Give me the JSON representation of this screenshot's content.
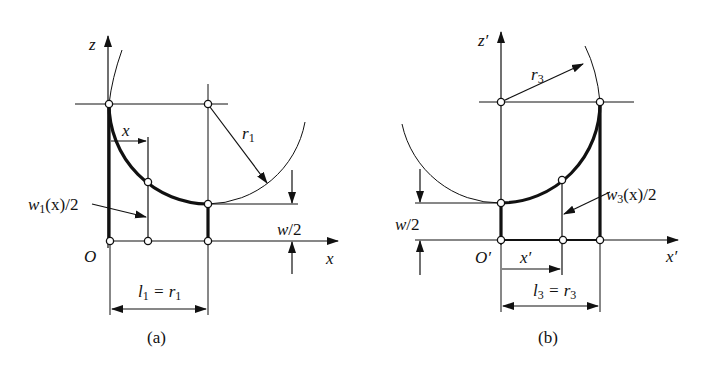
{
  "figure_a": {
    "axis_z_label": "z",
    "axis_x_label": "x",
    "origin_label": "O",
    "x_dim_label": "x",
    "radius_label": "r",
    "radius_sub": "1",
    "width_fn_label_w": "w",
    "width_fn_sub": "1",
    "width_fn_rest": "(x)/2",
    "half_width_label": "w/2",
    "length_l": "l",
    "length_l_sub": "1",
    "length_eq": " = r",
    "length_r_sub": "1",
    "caption": "(a)"
  },
  "figure_b": {
    "axis_z_label": "z′",
    "axis_x_label": "x′",
    "origin_label": "O′",
    "x_dim_label": "x′",
    "radius_label": "r",
    "radius_sub": "3",
    "width_fn_label_w": "w",
    "width_fn_sub": "3",
    "width_fn_rest": "(x)/2",
    "half_width_label": "w/2",
    "length_l": "l",
    "length_l_sub": "3",
    "length_eq": " = r",
    "length_r_sub": "3",
    "caption": "(b)"
  },
  "colors": {
    "ink": "#111111",
    "background": "#ffffff"
  }
}
